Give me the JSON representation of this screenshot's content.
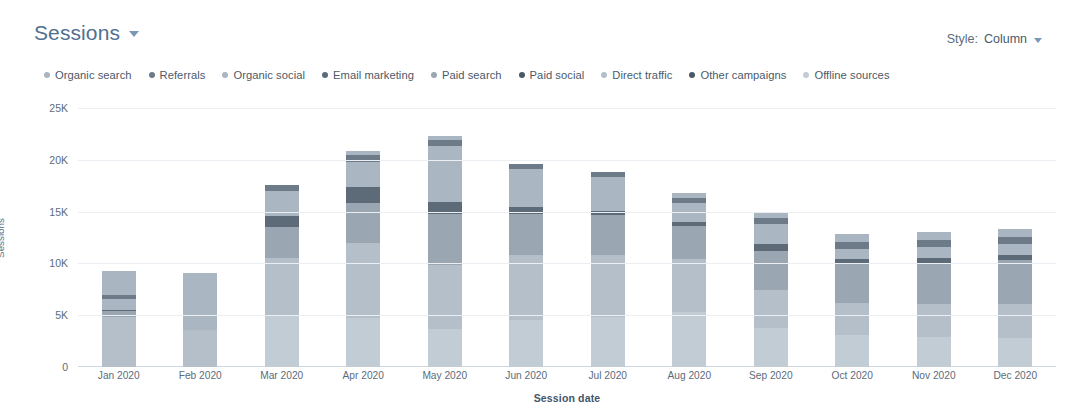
{
  "header": {
    "title": "Sessions",
    "title_caret_icon": "chevron-down-icon",
    "style_label": "Style:",
    "style_value": "Column",
    "style_caret_icon": "chevron-down-icon"
  },
  "chart_data": {
    "type": "bar",
    "stacked": true,
    "title": "Sessions",
    "xlabel": "Session date",
    "ylabel": "Sessions",
    "ylim": [
      0,
      25000
    ],
    "yticks": [
      0,
      5000,
      10000,
      15000,
      20000,
      25000
    ],
    "ytick_labels": [
      "0",
      "5K",
      "10K",
      "15K",
      "20K",
      "25K"
    ],
    "grid": true,
    "legend_position": "top-left",
    "categories": [
      "Jan 2020",
      "Feb 2020",
      "Mar 2020",
      "Apr 2020",
      "May 2020",
      "Jun 2020",
      "Jul 2020",
      "Aug 2020",
      "Sep 2020",
      "Oct 2020",
      "Nov 2020",
      "Dec 2020"
    ],
    "series": [
      {
        "name": "Organic search",
        "color": "#a9b5c0",
        "values": [
          2300,
          0,
          0,
          400,
          400,
          0,
          0,
          500,
          600,
          700,
          700,
          700
        ]
      },
      {
        "name": "Referrals",
        "color": "#6d7a87",
        "values": [
          400,
          0,
          600,
          700,
          600,
          500,
          500,
          500,
          600,
          700,
          700,
          700
        ]
      },
      {
        "name": "Organic social",
        "color": "#aab6c1",
        "values": [
          1100,
          5500,
          2400,
          2400,
          5400,
          3700,
          3200,
          1800,
          1900,
          1000,
          1100,
          1100
        ]
      },
      {
        "name": "Email marketing",
        "color": "#5d6b78",
        "values": [
          100,
          0,
          1100,
          1600,
          1100,
          600,
          400,
          400,
          700,
          500,
          500,
          500
        ]
      },
      {
        "name": "Paid search",
        "color": "#9aa6b2",
        "values": [
          600,
          0,
          3000,
          3800,
          5000,
          4000,
          3900,
          3200,
          3800,
          3700,
          3900,
          4200
        ]
      },
      {
        "name": "Paid social",
        "color": "#4a5865",
        "values": [
          0,
          0,
          0,
          0,
          0,
          0,
          0,
          0,
          0,
          0,
          0,
          0
        ]
      },
      {
        "name": "Direct traffic",
        "color": "#b4bfc9",
        "values": [
          4800,
          3600,
          5600,
          7300,
          6100,
          6300,
          6000,
          5100,
          3600,
          3100,
          3200,
          3300
        ]
      },
      {
        "name": "Other campaigns",
        "color": "#4b5865",
        "values": [
          0,
          0,
          0,
          0,
          0,
          0,
          0,
          0,
          0,
          0,
          0,
          0
        ]
      },
      {
        "name": "Offline sources",
        "color": "#c2ccd5",
        "values": [
          0,
          0,
          4900,
          4700,
          3700,
          4500,
          4800,
          5300,
          3800,
          3100,
          2900,
          2800
        ]
      }
    ],
    "totals": [
      9300,
      9100,
      17600,
      20900,
      22300,
      20600,
      18800,
      16800,
      15000,
      12800,
      13000,
      13300
    ]
  }
}
